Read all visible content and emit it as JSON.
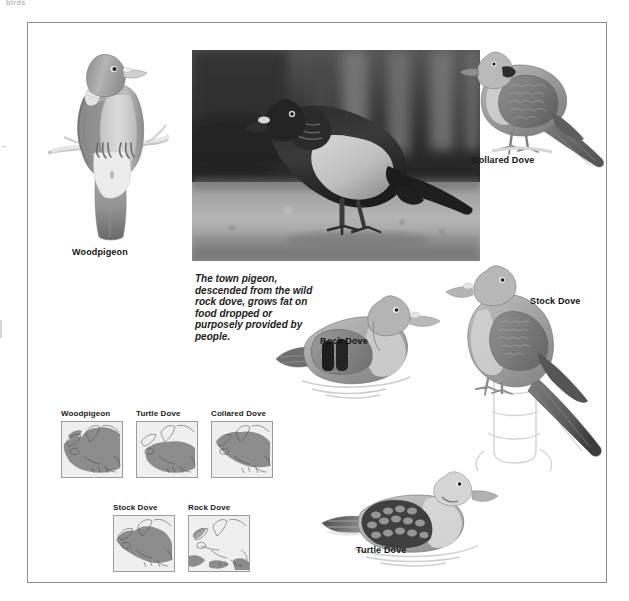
{
  "page": {
    "running_head": "birds",
    "frame_present": true
  },
  "photo": {
    "name": "town-pigeon-photograph",
    "subject": "Town pigeon standing on pavement",
    "caption": "The town pigeon, descended from the wild rock dove, grows fat on food dropped or purposely provided by people."
  },
  "illustrations": [
    {
      "id": "woodpigeon",
      "label": "Woodpigeon",
      "pose": "perched on branch, front view"
    },
    {
      "id": "collared-dove",
      "label": "Collared Dove",
      "pose": "standing, side view facing left"
    },
    {
      "id": "rock-dove",
      "label": "Rock Dove",
      "pose": "squatting, side view facing right"
    },
    {
      "id": "stock-dove",
      "label": "Stock Dove",
      "pose": "perched on post, side view facing left"
    },
    {
      "id": "turtle-dove",
      "label": "Turtle Dove",
      "pose": "squatting on ground, side view facing right"
    }
  ],
  "maps": {
    "section_name": "distribution-maps",
    "region": "Europe",
    "row1": [
      {
        "id": "map-woodpigeon",
        "title": "Woodpigeon",
        "coverage": "almost all of Europe including Britain and Scandinavia"
      },
      {
        "id": "map-turtle-dove",
        "title": "Turtle Dove",
        "coverage": "central and southern Europe, southern Britain"
      },
      {
        "id": "map-collared-dove",
        "title": "Collared Dove",
        "coverage": "central and northern Europe, Britain"
      }
    ],
    "row2": [
      {
        "id": "map-stock-dove",
        "title": "Stock Dove",
        "coverage": "western and central Europe, Britain"
      },
      {
        "id": "map-rock-dove",
        "title": "Rock Dove",
        "coverage": "Mediterranean coasts and fringes only"
      }
    ]
  },
  "colors": {
    "frame": "#8b8b8b",
    "text": "#111111",
    "map_land": "#f2f2f2",
    "map_range": "#8c8c8c",
    "map_border": "#9c9c9c",
    "photo_dark": "#1c1c1c",
    "photo_light": "#c8c8c8",
    "running_head": "#b9b9b9"
  }
}
